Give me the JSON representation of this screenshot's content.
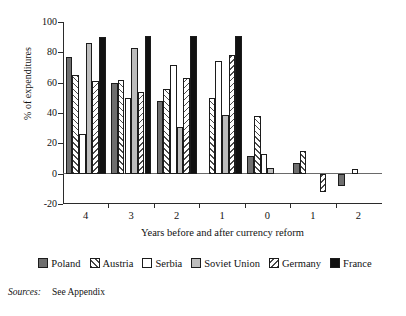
{
  "chart_data": {
    "type": "bar",
    "title": "",
    "xlabel": "Years before and after currency reform",
    "ylabel": "% of expenditures",
    "ylim": [
      -20,
      100
    ],
    "yticks": [
      100,
      80,
      60,
      40,
      20,
      0,
      -20
    ],
    "grid": false,
    "legend_position": "bottom",
    "categories": [
      "4",
      "3",
      "2",
      "1",
      "0",
      "1",
      "2"
    ],
    "category_note": "first four are years before reform, then year 0, then years after reform",
    "series": [
      {
        "name": "Poland",
        "color": "#6f6f6f",
        "pattern": "solid",
        "values": [
          77,
          60,
          48,
          null,
          12,
          7,
          -8
        ]
      },
      {
        "name": "Austria",
        "color": "#ffffff",
        "pattern": "diagonal-forward-hatch",
        "values": [
          65,
          62,
          56,
          50,
          38,
          15,
          null
        ]
      },
      {
        "name": "Serbia",
        "color": "#ffffff",
        "pattern": "solid",
        "values": [
          26,
          50,
          72,
          74,
          13,
          null,
          3
        ]
      },
      {
        "name": "Soviet Union",
        "color": "#bdbdbd",
        "pattern": "solid",
        "values": [
          86,
          83,
          31,
          39,
          4,
          null,
          null
        ]
      },
      {
        "name": "Germany",
        "color": "#ffffff",
        "pattern": "diagonal-back-hatch",
        "values": [
          61,
          54,
          63,
          78,
          null,
          -12,
          null
        ]
      },
      {
        "name": "France",
        "color": "#111111",
        "pattern": "solid",
        "values": [
          90,
          91,
          91,
          91,
          null,
          null,
          null
        ]
      }
    ]
  },
  "axes": {
    "y_title": "% of expenditures",
    "x_title": "Years before and after currency reform",
    "y_tick_labels": [
      "100",
      "80",
      "60",
      "40",
      "20",
      "0",
      "-20"
    ],
    "x_tick_labels": [
      "4",
      "3",
      "2",
      "1",
      "0",
      "1",
      "2"
    ]
  },
  "legend": {
    "items": [
      {
        "label": "Poland"
      },
      {
        "label": "Austria"
      },
      {
        "label": "Serbia"
      },
      {
        "label": "Soviet Union"
      },
      {
        "label": "Germany"
      },
      {
        "label": "France"
      }
    ]
  },
  "source": {
    "label": "Sources:",
    "text": "See Appendix"
  }
}
